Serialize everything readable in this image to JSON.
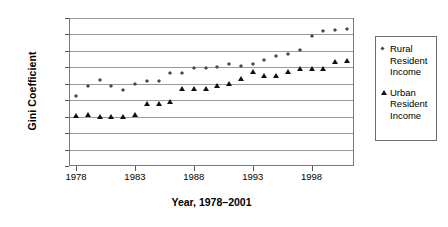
{
  "chart_data": {
    "type": "scatter",
    "title": "",
    "xlabel": "Year, 1978–2001",
    "ylabel": "Gini Coefficient",
    "xlim": [
      1977.4,
      2001.6
    ],
    "ylim": [
      0,
      0.45
    ],
    "grid": true,
    "legend_position": "right",
    "x": [
      1978,
      1979,
      1980,
      1981,
      1982,
      1983,
      1984,
      1985,
      1986,
      1987,
      1988,
      1989,
      1990,
      1991,
      1992,
      1993,
      1994,
      1995,
      1996,
      1997,
      1998,
      1999,
      2000,
      2001
    ],
    "xticks": [
      "1978",
      "1983",
      "1988",
      "1993",
      "1998"
    ],
    "xtick_values": [
      1978,
      1983,
      1988,
      1993,
      1998
    ],
    "yticks": [
      "0",
      "0.05",
      "0.1",
      "0.15",
      "0.2",
      "0.25",
      "0.3",
      "0.35",
      "0.4",
      "0.45"
    ],
    "ytick_values": [
      0,
      0.05,
      0.1,
      0.15,
      0.2,
      0.25,
      0.3,
      0.35,
      0.4,
      0.45
    ],
    "series": [
      {
        "name": "Rural Resident Income",
        "marker": "diamond",
        "color": "#4a4a4a",
        "values": [
          0.212,
          0.244,
          0.26,
          0.243,
          0.231,
          0.248,
          0.257,
          0.258,
          0.284,
          0.284,
          0.299,
          0.299,
          0.301,
          0.31,
          0.304,
          0.31,
          0.321,
          0.334,
          0.341,
          0.354,
          0.394,
          0.41,
          0.415,
          0.417
        ]
      },
      {
        "name": "Urban Resident Income",
        "marker": "triangle",
        "color": "#111111",
        "values": [
          0.152,
          0.155,
          0.148,
          0.148,
          0.148,
          0.155,
          0.19,
          0.189,
          0.196,
          0.234,
          0.234,
          0.234,
          0.242,
          0.25,
          0.265,
          0.287,
          0.274,
          0.274,
          0.285,
          0.295,
          0.295,
          0.295,
          0.315,
          0.32
        ]
      }
    ]
  },
  "legend": {
    "entries": [
      {
        "lines": [
          "Rural",
          "Resident",
          "Income"
        ]
      },
      {
        "lines": [
          "Urban",
          "Resident",
          "Income"
        ]
      }
    ]
  }
}
